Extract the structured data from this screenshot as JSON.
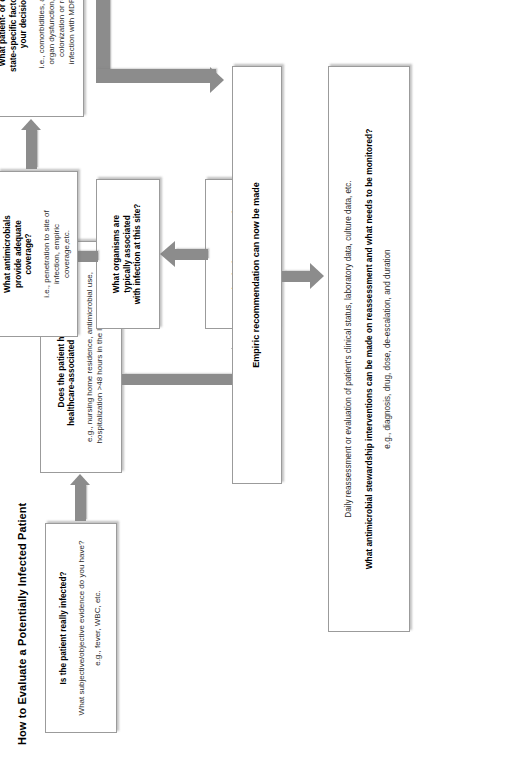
{
  "diagram": {
    "title": "How to Evaluate a Potentially Infected Patient",
    "nodes": {
      "infected": {
        "heading": "Is the patient really infected?",
        "question": "What subjective/objective evidence do you have?",
        "example": "e.g., fever, WBC, etc."
      },
      "risk_factors": {
        "heading_line1": "Does the patient have any",
        "heading_line2": "healthcare-associated risk factors?",
        "example_line1": "e.g., nursing home residence, antimicrobial use,",
        "example_line2": "hospitalization >48 hours in the last 90 days, etc."
      },
      "site_source": {
        "heading_line1": "What is the suspected",
        "heading_line2": "site/source of infection?"
      },
      "organisms": {
        "heading_line1": "What organisms are",
        "heading_line2": "typically associated",
        "heading_line3": "with infection at this site?"
      },
      "antimicrobials": {
        "heading_line1": "What antimicrobials",
        "heading_line2": "provide adequate",
        "heading_line3": "coverage?",
        "example_line1": "i.e., penetration to site of",
        "example_line2": "infection, empiric",
        "example_line3": "coverage,etc."
      },
      "patient_factors": {
        "heading_line1": "What patient- or disease",
        "heading_line2": "state-specific factors affect",
        "heading_line3": "your decision?",
        "example_line1": "i.e., comorbidities, allergies,",
        "example_line2": "organ dysfunction, known",
        "example_line3": "colonization or recent",
        "example_line4": "infection with MDRO, etc."
      },
      "empiric": {
        "heading": "Empiric recommendation can now be made"
      },
      "reassessment": {
        "line1": "Daily reassessment or evaluation of patient's clinical status, laboratory data, culture data, etc.",
        "line2": "What antimicrobial stewardship interventions can be made on reassessment and what needs to be monitored?",
        "line3": "e.g., diagnosis, drug, dose, de-escalation, and duration"
      }
    },
    "colors": {
      "arrow": "#8c8c8c",
      "box_border": "#9b9b9b",
      "text": "#1a1a1a",
      "background": "#ffffff"
    }
  }
}
